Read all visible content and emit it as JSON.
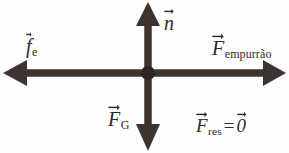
{
  "diagram": {
    "background_color": "#fdfdfd",
    "stroke_color": "#3d3430",
    "center": {
      "x": 148,
      "y": 73
    },
    "pivot_name": "center-dot"
  },
  "vectors": [
    {
      "name": "friction-vector",
      "direction": "left",
      "symbol": "f",
      "subscript": "e",
      "label_text": "f",
      "tip": {
        "x": 4,
        "y": 73
      }
    },
    {
      "name": "normal-vector",
      "direction": "up",
      "symbol": "n",
      "subscript": "",
      "label_text": "n",
      "tip": {
        "x": 148,
        "y": 4
      }
    },
    {
      "name": "push-vector",
      "direction": "right",
      "symbol": "F",
      "subscript": "empurrão",
      "label_text": "F",
      "tip": {
        "x": 285,
        "y": 73
      }
    },
    {
      "name": "gravity-vector",
      "direction": "down",
      "symbol": "F",
      "subscript": "G",
      "label_text": "F",
      "tip": {
        "x": 148,
        "y": 149
      }
    }
  ],
  "equation": {
    "lhs_symbol": "F",
    "lhs_subscript": "res",
    "operator": "=",
    "rhs_symbol": "0",
    "full_text": "F_res = 0"
  }
}
